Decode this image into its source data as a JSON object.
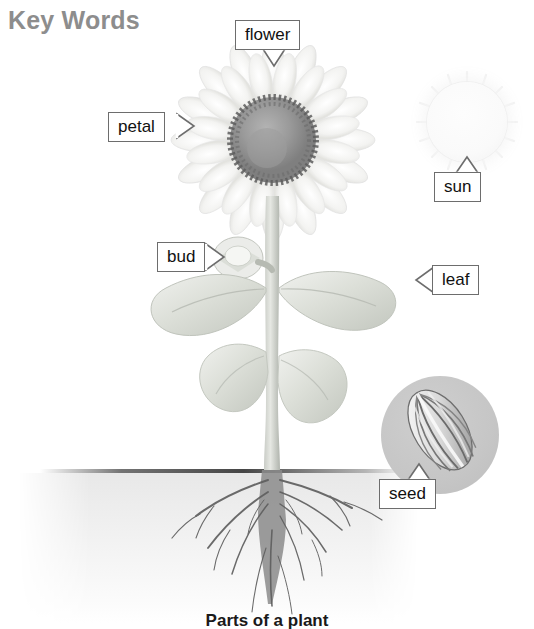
{
  "page": {
    "title": "Key Words",
    "caption": "Parts of a plant",
    "title_color": "#8d8d8d",
    "background": "#ffffff"
  },
  "labels": [
    {
      "id": "flower",
      "text": "flower",
      "pointer": "down",
      "x": 235,
      "y": 20,
      "target_x": 273,
      "target_y": 68
    },
    {
      "id": "petal",
      "text": "petal",
      "pointer": "right",
      "x": 108,
      "y": 112,
      "target_x": 196,
      "target_y": 126
    },
    {
      "id": "sun",
      "text": "sun",
      "pointer": "up",
      "x": 434,
      "y": 172,
      "target_x": 467,
      "target_y": 160
    },
    {
      "id": "bud",
      "text": "bud",
      "pointer": "right",
      "x": 157,
      "y": 242,
      "target_x": 226,
      "target_y": 258
    },
    {
      "id": "leaf",
      "text": "leaf",
      "pointer": "left",
      "x": 432,
      "y": 265,
      "target_x": 398,
      "target_y": 280
    },
    {
      "id": "seed",
      "text": "seed",
      "pointer": "up",
      "x": 379,
      "y": 479,
      "target_x": 418,
      "target_y": 468
    }
  ],
  "illustration": {
    "flower_head": {
      "center_x": 273,
      "center_y": 140,
      "petal_radius": 92,
      "disc_radius": 42
    },
    "sun": {
      "center_x": 467,
      "center_y": 122,
      "radius": 40,
      "color": "#f7f7f7"
    },
    "seed_inset": {
      "center_x": 440,
      "center_y": 435,
      "radius": 59,
      "color": "#c6c6c6"
    },
    "soil_line_y": 471,
    "stem_x": 272,
    "leaves": 4,
    "colors": {
      "stem": "#b9bcb6",
      "leaf": "#d8dbd4",
      "disc": "#8e8e8e",
      "petal": "#f0f0ee",
      "root": "#6f6f6f",
      "label_border": "#6d6d6d",
      "label_text": "#111111"
    }
  }
}
